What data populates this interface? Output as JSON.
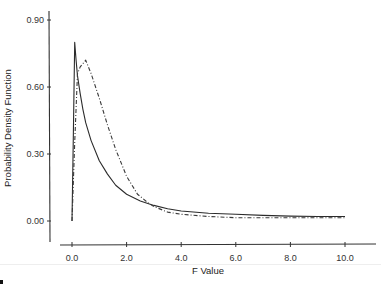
{
  "chart_data": {
    "type": "line",
    "title": "",
    "xlabel": "F Value",
    "ylabel": "Probability Density Function",
    "xlim": [
      0,
      10.5
    ],
    "ylim": [
      -0.06,
      0.93
    ],
    "x_ticks": [
      "0.0",
      "2.0",
      "4.0",
      "6.0",
      "8.0",
      "10.0"
    ],
    "y_ticks": [
      "0.00",
      "0.30",
      "0.60",
      "0.90"
    ],
    "grid": false,
    "legend": null,
    "series": [
      {
        "name": "solid",
        "style": "solid",
        "color": "#2b2b2b",
        "x": [
          0.0,
          0.05,
          0.1,
          0.15,
          0.2,
          0.3,
          0.4,
          0.5,
          0.7,
          1.0,
          1.3,
          1.6,
          2.0,
          2.5,
          3.0,
          3.5,
          4.0,
          5.0,
          6.0,
          7.0,
          8.0,
          9.0,
          10.0
        ],
        "y": [
          0.0,
          0.4,
          0.8,
          0.72,
          0.65,
          0.57,
          0.5,
          0.44,
          0.36,
          0.27,
          0.21,
          0.16,
          0.12,
          0.09,
          0.07,
          0.055,
          0.045,
          0.035,
          0.03,
          0.025,
          0.022,
          0.02,
          0.02
        ]
      },
      {
        "name": "dash-dot",
        "style": "dashdot",
        "color": "#3a3a3a",
        "x": [
          0.0,
          0.1,
          0.2,
          0.3,
          0.5,
          0.7,
          1.0,
          1.3,
          1.6,
          2.0,
          2.4,
          2.8,
          3.0,
          3.5,
          4.0,
          5.0,
          6.0,
          7.0,
          8.0,
          9.0,
          10.0
        ],
        "y": [
          0.0,
          0.35,
          0.66,
          0.69,
          0.72,
          0.66,
          0.55,
          0.43,
          0.32,
          0.2,
          0.12,
          0.08,
          0.065,
          0.04,
          0.03,
          0.02,
          0.015,
          0.015,
          0.015,
          0.015,
          0.015
        ]
      }
    ]
  }
}
